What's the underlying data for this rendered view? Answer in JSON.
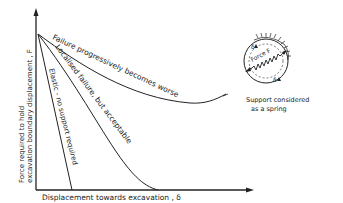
{
  "diagram": {
    "ink_color": "#222222",
    "background": "#ffffff",
    "axes": {
      "y_label_line1": "Force required to hold",
      "y_label_line2": "excavation boundary displacement , F",
      "x_label": "Displacement towards excavation , δ"
    },
    "curves": [
      {
        "id": "failure-worse",
        "label": "Failure progressively becomes worse"
      },
      {
        "id": "localised-failure",
        "label": "Localised failure, but acceptable"
      },
      {
        "id": "elastic",
        "label": "Elastic - no support required"
      }
    ],
    "inset": {
      "spring_label": "Force F",
      "delta_top": "δ",
      "delta_bottom": "δ",
      "caption_line1": "Support considered",
      "caption_line2": "as a spring"
    }
  }
}
